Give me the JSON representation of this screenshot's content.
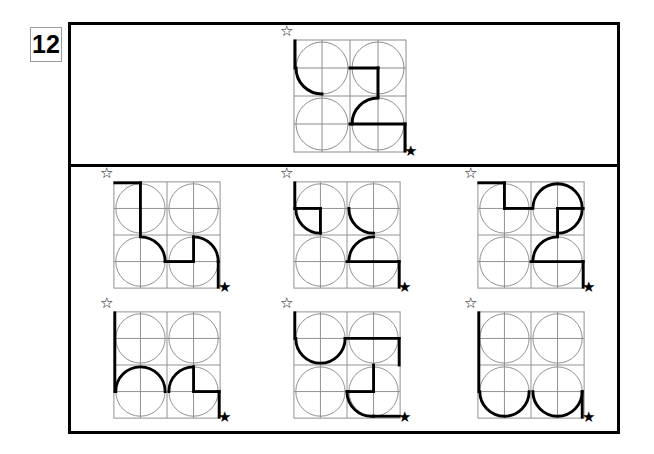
{
  "puzzle": {
    "label": "12",
    "type": "visual-analogy-matrix",
    "description": "Abstract reasoning puzzle: a question figure on top and six answer option figures below.",
    "stars": {
      "hollow_glyph": "☆",
      "hollow_name": "star-outline-icon",
      "filled_glyph": "★",
      "filled_name": "star-filled-icon"
    },
    "colors": {
      "frame": "#000000",
      "grid_light": "#8c8c8c",
      "stroke_bold": "#000000",
      "background": "#ffffff"
    },
    "figure_geometry": {
      "cell_count": 4,
      "grid": "2x2",
      "each_cell": "circle inscribed plus horizontal and vertical mid-lines"
    },
    "question": {
      "name": "question-figure",
      "index": 0,
      "bold_elements": [
        "top-left cell: bold left edge descending to mid",
        "top-left cell: bold lower-left quarter arc",
        "top-right cell: bold horizontal at mid from cell-left to cell-center",
        "top-right cell: bold vertical from cell-center descending to cell-bottom",
        "bottom-right cell: bold upper-left quarter arc",
        "bottom-right cell: bold horizontal at mid extending to right edge",
        "bottom-right cell: bold right edge descending to bottom"
      ]
    },
    "options": [
      {
        "name": "option-1",
        "index": 1,
        "bold_elements": [
          "top-left cell: bold top edge from panel-left to cell-center",
          "top-left cell: bold vertical from top descending to mid",
          "bottom-left cell: bold lower-right quarter arc",
          "bottom-right cell: bold horizontal at lower-mid",
          "bottom-right cell: bold vertical at cell-center",
          "bottom-right cell: bold upper-right quarter arc",
          "bottom-right cell: bold right edge descending"
        ]
      },
      {
        "name": "option-2",
        "index": 2,
        "bold_elements": [
          "top-left cell: bold left edge descending to mid",
          "top-left cell: bold horizontal at mid from left to cell-center",
          "top-left cell: bold vertical descending from cell-center",
          "top-left cell: bold lower-left quarter arc",
          "top-right cell: bold lower-left quarter arc",
          "bottom-right cell: bold upper-left quarter arc",
          "bottom-right cell: bold horizontal at mid to right edge",
          "bottom-right cell: bold right edge descending"
        ]
      },
      {
        "name": "option-3",
        "index": 3,
        "bold_elements": [
          "top-left cell: bold top edge to cell-center",
          "top-left cell: bold vertical descending to mid",
          "top-left cell: bold horizontal at mid to cell-right",
          "top-right cell: bold upper-right three-quarter arc",
          "top-right cell: bold horizontal at mid",
          "top-right cell: bold vertical descending at cell-center",
          "bottom-right cell: bold upper-left quarter arc",
          "bottom-right cell: bold horizontal at mid to right edge",
          "bottom-right cell: bold right edge descending"
        ]
      },
      {
        "name": "option-4",
        "index": 4,
        "bold_elements": [
          "top-left cell: bold left edge descending full height",
          "bottom-left cell: bold upper semicircle arc",
          "bottom-right cell: bold upper-left quarter arc",
          "bottom-right cell: bold vertical at cell-center",
          "bottom-right cell: bold horizontal at mid to right edge",
          "bottom-right cell: bold right edge descending"
        ]
      },
      {
        "name": "option-5",
        "index": 5,
        "bold_elements": [
          "top-left cell: bold left edge descending to mid",
          "top-left cell: bold lower-left half arc",
          "top-right cell: bold horizontal at mid across full width",
          "top-right cell: bold right edge descending",
          "bottom-right cell: bold vertical at cell-center",
          "bottom-right cell: bold horizontal at lower-mid",
          "bottom-right cell: bold lower-left quarter arc"
        ]
      },
      {
        "name": "option-6",
        "index": 6,
        "bold_elements": [
          "top-left cell: bold left edge descending full height",
          "bottom-left cell: bold lower semicircle arc",
          "bottom-right cell: bold lower semicircle arc",
          "bottom-right cell: bold right edge ascending segment"
        ]
      }
    ]
  }
}
